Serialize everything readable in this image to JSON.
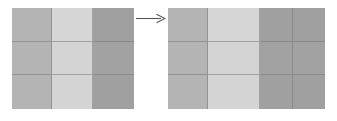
{
  "figure": {
    "background_color": "#ffffff",
    "gridline_color": "#787878",
    "arrow": {
      "icon": "right-arrow-icon",
      "label": "transforms to",
      "color": "#555555",
      "direction": "right"
    },
    "palette": {
      "medium_gray": "#b4b4b4",
      "light_gray": "#d4d4d4",
      "dark_gray": "#a0a0a0"
    },
    "left_grid": {
      "label": "source grid",
      "rows": 3,
      "columns": 3,
      "column_widths": [
        40,
        41,
        41
      ],
      "cells": [
        [
          {
            "name": "cell-r1c1",
            "color": "#b4b4b4"
          },
          {
            "name": "cell-r1c2",
            "color": "#d6d6d6"
          },
          {
            "name": "cell-r1c3",
            "color": "#a0a0a0"
          }
        ],
        [
          {
            "name": "cell-r2c1",
            "color": "#b4b4b4"
          },
          {
            "name": "cell-r2c2",
            "color": "#d4d4d4"
          },
          {
            "name": "cell-r2c3",
            "color": "#a2a2a2"
          }
        ],
        [
          {
            "name": "cell-r3c1",
            "color": "#b4b4b4"
          },
          {
            "name": "cell-r3c2",
            "color": "#d4d4d4"
          },
          {
            "name": "cell-r3c3",
            "color": "#a0a0a0"
          }
        ]
      ]
    },
    "right_grid": {
      "label": "result grid",
      "rows": 3,
      "columns": 4,
      "column_widths": [
        40,
        52,
        33,
        32
      ],
      "cells": [
        [
          {
            "name": "cell-r1c1",
            "color": "#b4b4b4"
          },
          {
            "name": "cell-r1c2",
            "color": "#d6d6d6"
          },
          {
            "name": "cell-r1c3",
            "color": "#a0a0a0"
          },
          {
            "name": "cell-r1c4",
            "color": "#a0a0a0"
          }
        ],
        [
          {
            "name": "cell-r2c1",
            "color": "#b4b4b4"
          },
          {
            "name": "cell-r2c2",
            "color": "#d4d4d4"
          },
          {
            "name": "cell-r2c3",
            "color": "#a2a2a2"
          },
          {
            "name": "cell-r2c4",
            "color": "#a2a2a2"
          }
        ],
        [
          {
            "name": "cell-r3c1",
            "color": "#b4b4b4"
          },
          {
            "name": "cell-r3c2",
            "color": "#d4d4d4"
          },
          {
            "name": "cell-r3c3",
            "color": "#a0a0a0"
          },
          {
            "name": "cell-r3c4",
            "color": "#a0a0a0"
          }
        ]
      ]
    }
  }
}
